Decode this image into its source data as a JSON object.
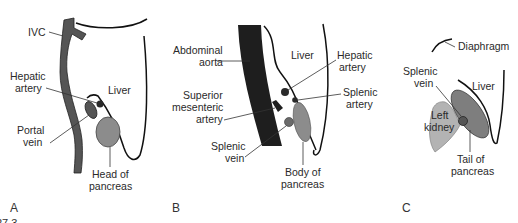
{
  "figure": {
    "number_fragment": "27.3",
    "colors": {
      "vessel_dark": "#555555",
      "aorta_black": "#1e1e1e",
      "organ_mid_gray": "#8c8c8c",
      "kidney_light_gray": "#b3b3b3",
      "outline": "#111111",
      "text": "#2a2a2a"
    }
  },
  "panels": [
    {
      "letter": "A",
      "labels": {
        "ivc": "IVC",
        "hepatic_artery_line1": "Hepatic",
        "hepatic_artery_line2": "artery",
        "liver": "Liver",
        "portal_vein_line1": "Portal",
        "portal_vein_line2": "vein",
        "head_of_pancreas_line1": "Head of",
        "head_of_pancreas_line2": "pancreas"
      }
    },
    {
      "letter": "B",
      "labels": {
        "abdominal_aorta_line1": "Abdominal",
        "abdominal_aorta_line2": "aorta",
        "liver": "Liver",
        "hepatic_artery_line1": "Hepatic",
        "hepatic_artery_line2": "artery",
        "superior_mesenteric_artery_line1": "Superior",
        "superior_mesenteric_artery_line2": "mesenteric",
        "superior_mesenteric_artery_line3": "artery",
        "splenic_artery_line1": "Splenic",
        "splenic_artery_line2": "artery",
        "splenic_vein_line1": "Splenic",
        "splenic_vein_line2": "vein",
        "body_of_pancreas_line1": "Body of",
        "body_of_pancreas_line2": "pancreas"
      }
    },
    {
      "letter": "C",
      "labels": {
        "diaphragm": "Diaphragm",
        "splenic_vein_line1": "Splenic",
        "splenic_vein_line2": "vein",
        "liver": "Liver",
        "left_kidney_line1": "Left",
        "left_kidney_line2": "kidney",
        "tail_of_pancreas_line1": "Tail of",
        "tail_of_pancreas_line2": "pancreas"
      }
    }
  ]
}
